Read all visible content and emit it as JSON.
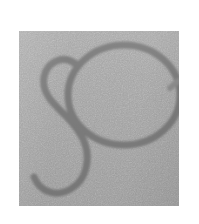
{
  "canvas": {
    "width": 199,
    "height": 224,
    "background_color": "#ffffff",
    "description": "Low-resolution grayscale scan of a drawn sign"
  },
  "plate": {
    "name": "gray-image-plate",
    "x": 19,
    "y": 31,
    "width": 160,
    "height": 175,
    "fill_color": "#a3a3a3",
    "texture": "fine grain noise"
  },
  "figure": {
    "label": "script-s-with-loop",
    "stroke_color": "#7d7d7d",
    "stroke_color_light": "#8d8d8d",
    "stroke_width": 7,
    "parts": [
      {
        "name": "large-loop",
        "shape": "ellipse",
        "center_x": 105,
        "center_y": 64,
        "radius_x": 56,
        "radius_y": 50
      },
      {
        "name": "s-descender-curve",
        "shape": "path",
        "start": [
          57,
          37
        ],
        "end": [
          9,
          160
        ]
      },
      {
        "name": "right-tick",
        "shape": "path",
        "start": [
          160,
          52
        ],
        "end": [
          152,
          58
        ]
      }
    ]
  }
}
